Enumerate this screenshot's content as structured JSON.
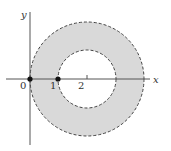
{
  "figure": {
    "colors": {
      "fill": "#d9d9d9",
      "stroke": "#444444",
      "axis": "#555555",
      "background": "#ffffff"
    },
    "axes": {
      "x_label": "x",
      "y_label": "y"
    },
    "tick_labels": {
      "origin": "0",
      "one": "1",
      "two": "2"
    },
    "annulus": {
      "center": [
        2,
        0
      ],
      "inner_radius": 1,
      "outer_radius": 2,
      "boundary_style": "dashed"
    },
    "points": [
      {
        "label": "0",
        "x": 0,
        "y": 0
      },
      {
        "label": "1",
        "x": 1,
        "y": 0
      }
    ]
  }
}
